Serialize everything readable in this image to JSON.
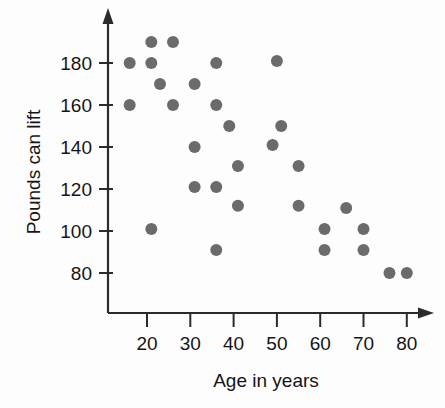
{
  "chart_data": {
    "type": "scatter",
    "title": "",
    "xlabel": "Age in years",
    "ylabel": "Pounds can lift",
    "xlim": [
      10,
      85
    ],
    "ylim": [
      70,
      196
    ],
    "xticks": [
      20,
      30,
      40,
      50,
      60,
      70,
      80
    ],
    "xtick_labels": [
      "20",
      "30",
      "40",
      "50",
      "60",
      "70",
      "80"
    ],
    "yticks": [
      80,
      100,
      120,
      140,
      160,
      180
    ],
    "ytick_labels": [
      "80",
      "100",
      "120",
      "140",
      "160",
      "180"
    ],
    "grid": false,
    "legend": null,
    "marker": {
      "shape": "circle",
      "color": "#6b6b6b",
      "radius_px": 6
    },
    "axis_color": "#2b2b2b",
    "background_color": "#fdfdfd",
    "x_axis_arrow": true,
    "y_axis_arrow": true,
    "n_points": 31,
    "points": [
      {
        "x": 16,
        "y": 180
      },
      {
        "x": 16,
        "y": 160
      },
      {
        "x": 21,
        "y": 190
      },
      {
        "x": 21,
        "y": 180
      },
      {
        "x": 21,
        "y": 101
      },
      {
        "x": 23,
        "y": 170
      },
      {
        "x": 26,
        "y": 190
      },
      {
        "x": 26,
        "y": 160
      },
      {
        "x": 31,
        "y": 170
      },
      {
        "x": 31,
        "y": 140
      },
      {
        "x": 31,
        "y": 121
      },
      {
        "x": 36,
        "y": 180
      },
      {
        "x": 36,
        "y": 160
      },
      {
        "x": 36,
        "y": 121
      },
      {
        "x": 36,
        "y": 91
      },
      {
        "x": 39,
        "y": 150
      },
      {
        "x": 41,
        "y": 131
      },
      {
        "x": 41,
        "y": 112
      },
      {
        "x": 49,
        "y": 141
      },
      {
        "x": 50,
        "y": 181
      },
      {
        "x": 51,
        "y": 150
      },
      {
        "x": 55,
        "y": 131
      },
      {
        "x": 55,
        "y": 112
      },
      {
        "x": 61,
        "y": 101
      },
      {
        "x": 61,
        "y": 91
      },
      {
        "x": 66,
        "y": 111
      },
      {
        "x": 70,
        "y": 101
      },
      {
        "x": 70,
        "y": 91
      },
      {
        "x": 76,
        "y": 80
      },
      {
        "x": 80,
        "y": 80
      }
    ]
  },
  "labels": {
    "y_axis_title": "Pounds can lift",
    "x_axis_title": "Age in years"
  }
}
